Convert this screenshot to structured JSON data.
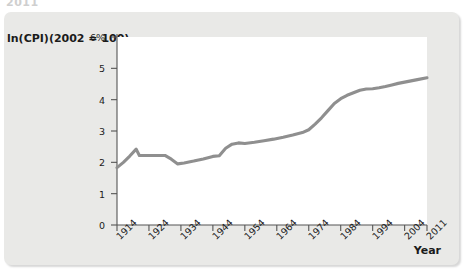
{
  "clipped_header_text": "2011",
  "chart_data": {
    "type": "line",
    "title": "",
    "ylabel": "ln(CPI)(2002 = 100)",
    "xlabel": "Year",
    "ylim": [
      0,
      6
    ],
    "xlim": [
      1914,
      2011
    ],
    "grid": false,
    "legend": null,
    "y_ticks": [
      {
        "value": 0,
        "label": "0"
      },
      {
        "value": 1,
        "label": "1"
      },
      {
        "value": 2,
        "label": "2"
      },
      {
        "value": 3,
        "label": "3"
      },
      {
        "value": 4,
        "label": "4"
      },
      {
        "value": 5,
        "label": "5"
      },
      {
        "value": 6,
        "label": "6%"
      }
    ],
    "x_ticks": [
      {
        "value": 1914,
        "label": "1914"
      },
      {
        "value": 1924,
        "label": "1924"
      },
      {
        "value": 1934,
        "label": "1934"
      },
      {
        "value": 1944,
        "label": "1944"
      },
      {
        "value": 1954,
        "label": "1954"
      },
      {
        "value": 1964,
        "label": "1964"
      },
      {
        "value": 1974,
        "label": "1974"
      },
      {
        "value": 1984,
        "label": "1984"
      },
      {
        "value": 1994,
        "label": "1994"
      },
      {
        "value": 2004,
        "label": "2004"
      },
      {
        "value": 2011,
        "label": "2011"
      }
    ],
    "series": [
      {
        "name": "ln(CPI)",
        "color": "#8f8f8f",
        "x": [
          1914,
          1916,
          1918,
          1920,
          1921,
          1923,
          1926,
          1929,
          1931,
          1933,
          1935,
          1938,
          1941,
          1944,
          1946,
          1948,
          1950,
          1952,
          1954,
          1957,
          1960,
          1963,
          1966,
          1969,
          1972,
          1974,
          1976,
          1978,
          1980,
          1982,
          1984,
          1986,
          1988,
          1990,
          1992,
          1994,
          1996,
          1998,
          2000,
          2002,
          2004,
          2006,
          2008,
          2011
        ],
        "y": [
          1.83,
          2.0,
          2.2,
          2.42,
          2.22,
          2.22,
          2.22,
          2.22,
          2.1,
          1.95,
          1.98,
          2.04,
          2.11,
          2.19,
          2.21,
          2.45,
          2.58,
          2.62,
          2.6,
          2.64,
          2.69,
          2.74,
          2.8,
          2.87,
          2.95,
          3.04,
          3.22,
          3.42,
          3.65,
          3.88,
          4.03,
          4.14,
          4.22,
          4.3,
          4.34,
          4.35,
          4.38,
          4.42,
          4.47,
          4.52,
          4.56,
          4.6,
          4.64,
          4.7
        ]
      }
    ]
  }
}
